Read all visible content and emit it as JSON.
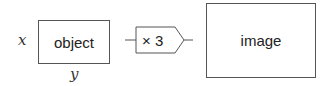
{
  "diagram": {
    "input_variable": "x",
    "output_variable": "y",
    "object_box": {
      "label": "object"
    },
    "multiplier": {
      "label": "× 3"
    },
    "image_box": {
      "label": "image"
    }
  },
  "colors": {
    "stroke": "#555555",
    "text": "#222222",
    "background": "#ffffff"
  }
}
